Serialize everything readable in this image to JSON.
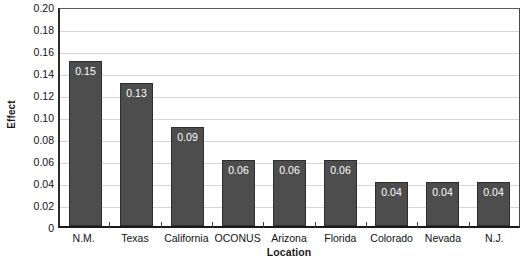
{
  "chart_data": {
    "type": "bar",
    "title": "",
    "xlabel": "Location",
    "ylabel": "Effect",
    "categories": [
      "N.M.",
      "Texas",
      "California",
      "OCONUS",
      "Arizona",
      "Florida",
      "Colorado",
      "Nevada",
      "N.J."
    ],
    "values": [
      0.15,
      0.13,
      0.09,
      0.06,
      0.06,
      0.06,
      0.04,
      0.04,
      0.04
    ],
    "data_labels": [
      "0.15",
      "0.13",
      "0.09",
      "0.06",
      "0.06",
      "0.06",
      "0.04",
      "0.04",
      "0.04"
    ],
    "ylim": [
      0,
      0.2
    ],
    "ytick_values": [
      0.2,
      0.18,
      0.16,
      0.14,
      0.12,
      0.1,
      0.08,
      0.06,
      0.04,
      0.02,
      0
    ],
    "ytick_labels": [
      "0.20",
      "0.18",
      "0.16",
      "0.14",
      "0.12",
      "0.10",
      "0.08",
      "0.06",
      "0.04",
      "0.02",
      "0"
    ],
    "grid": true,
    "grid_axis": "y",
    "legend": false,
    "legend_position": "none",
    "bar_color": "#4d4d4d",
    "bar_border_color": "#2e2e2e",
    "data_label_color": "#ffffff",
    "gridline_color": "#d6d6d6",
    "axis_color": "#1a1a1a",
    "background_color": "#ffffff"
  }
}
